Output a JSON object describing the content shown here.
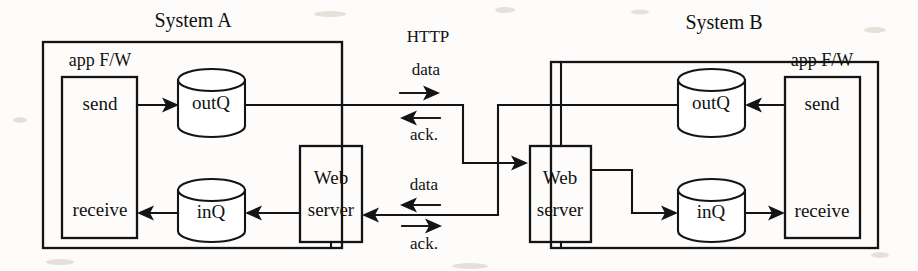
{
  "diagram": {
    "protocol_label": "HTTP",
    "systems": [
      {
        "id": "system-a",
        "name": "System A",
        "framework_label": "app F/W",
        "send_label": "send",
        "receive_label": "receive",
        "outq_label": "outQ",
        "inq_label": "inQ",
        "webserver_label_line1": "Web",
        "webserver_label_line2": "server"
      },
      {
        "id": "system-b",
        "name": "System B",
        "framework_label": "app F/W",
        "send_label": "send",
        "receive_label": "receive",
        "outq_label": "outQ",
        "inq_label": "inQ",
        "webserver_label_line1": "Web",
        "webserver_label_line2": "server"
      }
    ],
    "channels": [
      {
        "id": "channel-upper",
        "protocol": "HTTP",
        "request_label": "data",
        "response_label": "ack.",
        "request_direction": "right",
        "response_direction": "left",
        "description": "System A outQ pushes data to System B Web server; ack returns"
      },
      {
        "id": "channel-lower",
        "request_label": "data",
        "response_label": "ack.",
        "request_direction": "left",
        "response_direction": "right",
        "description": "System B outQ pushes data to System A Web server; ack returns"
      }
    ],
    "colors": {
      "ink": "#141414",
      "paper": "#fdfcfa"
    }
  }
}
